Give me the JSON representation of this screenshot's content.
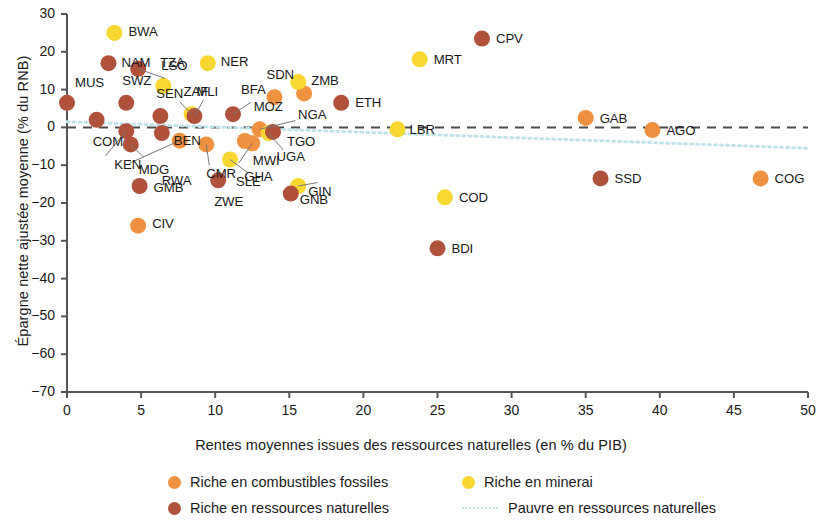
{
  "chart_data": {
    "type": "scatter",
    "title": "",
    "xlabel": "Rentes moyennes issues des ressources naturelles (en % du PIB)",
    "ylabel": "Épargne nette ajustée moyenne (% du RNB)",
    "xlim": [
      0,
      50
    ],
    "ylim": [
      -70,
      30
    ],
    "xticks": [
      0,
      5,
      10,
      15,
      20,
      25,
      30,
      35,
      40,
      45,
      50
    ],
    "yticks": [
      30,
      20,
      10,
      0,
      -10,
      -20,
      -30,
      -40,
      -50,
      -60,
      -70
    ],
    "grid": false,
    "legend_position": "bottom",
    "colors": {
      "fossil": "#f0913f",
      "mineral": "#f7d730",
      "natural": "#b0513c",
      "poor": "#bfe3e8",
      "zero_line": "#4a4a4a"
    },
    "reference_lines": [
      {
        "name": "zero-line",
        "kind": "dashed",
        "y": 0,
        "color": "#4a4a4a"
      },
      {
        "name": "poor-resources-trend",
        "kind": "dotted",
        "from": [
          0,
          1.5
        ],
        "to": [
          50,
          -5.5
        ],
        "color": "#bfe3e8"
      }
    ],
    "series": [
      {
        "name": "Riche en combustibles fossiles",
        "key": "fossil",
        "color": "#f0913f",
        "points": [
          {
            "code": "CIV",
            "x": 4.8,
            "y": -26.0,
            "lx": 14,
            "ly": -2
          },
          {
            "code": "RWA",
            "x": 7.6,
            "y": -3.5,
            "lx": -18,
            "ly": 40
          },
          {
            "code": "CMR",
            "x": 9.4,
            "y": -4.5,
            "lx": 0,
            "ly": 30
          },
          {
            "code": "MWI",
            "x": 12.0,
            "y": -3.6,
            "lx": 8,
            "ly": 20
          },
          {
            "code": "GHA",
            "x": 12.5,
            "y": -4.2,
            "lx": -8,
            "ly": 34
          },
          {
            "code": "MOZ",
            "x": 13.0,
            "y": -0.5,
            "lx": -6,
            "ly": -22
          },
          {
            "code": "SDN",
            "x": 14.0,
            "y": 8.0,
            "lx": -8,
            "ly": -22
          },
          {
            "code": "NGA",
            "x": 16.0,
            "y": 9.0,
            "lx": -6,
            "ly": 22
          },
          {
            "code": "GAB",
            "x": 35.0,
            "y": 2.5,
            "lx": 14,
            "ly": 1
          },
          {
            "code": "AGO",
            "x": 39.5,
            "y": -0.7,
            "lx": 14,
            "ly": 1
          },
          {
            "code": "COG",
            "x": 46.8,
            "y": -13.5,
            "lx": 14,
            "ly": 1
          }
        ]
      },
      {
        "name": "Riche en minerai",
        "key": "mineral",
        "color": "#f7d730",
        "points": [
          {
            "code": "BWA",
            "x": 3.2,
            "y": 25.0,
            "lx": 14,
            "ly": -1
          },
          {
            "code": "LSO",
            "x": 6.5,
            "y": 11.0,
            "lx": -2,
            "ly": -20
          },
          {
            "code": "ZAF",
            "x": 8.4,
            "y": 3.5,
            "lx": -8,
            "ly": -22
          },
          {
            "code": "NER",
            "x": 9.5,
            "y": 17.0,
            "lx": 13,
            "ly": -1
          },
          {
            "code": "SLE",
            "x": 11.0,
            "y": -8.5,
            "lx": 6,
            "ly": 22
          },
          {
            "code": "UGA",
            "x": 13.6,
            "y": -1.5,
            "lx": 8,
            "ly": 24
          },
          {
            "code": "ZMB",
            "x": 15.6,
            "y": 12.0,
            "lx": 13,
            "ly": -1
          },
          {
            "code": "GIN",
            "x": 15.6,
            "y": -15.5,
            "lx": 10,
            "ly": 6
          },
          {
            "code": "LBR",
            "x": 22.3,
            "y": -0.5,
            "lx": 12,
            "ly": 1
          },
          {
            "code": "MRT",
            "x": 23.8,
            "y": 18.0,
            "lx": 14,
            "ly": 1
          },
          {
            "code": "COD",
            "x": 25.5,
            "y": -18.5,
            "lx": 14,
            "ly": 1
          }
        ]
      },
      {
        "name": "Riche en ressources naturelles",
        "key": "natural",
        "color": "#b0513c",
        "points": [
          {
            "code": "MUS",
            "x": 0.0,
            "y": 6.5,
            "lx": 8,
            "ly": -20
          },
          {
            "code": "COM",
            "x": 2.0,
            "y": 2.0,
            "lx": -4,
            "ly": 22
          },
          {
            "code": "NAM",
            "x": 2.8,
            "y": 17.0,
            "lx": 13,
            "ly": 0
          },
          {
            "code": "SWZ",
            "x": 4.0,
            "y": 6.5,
            "lx": -4,
            "ly": -22
          },
          {
            "code": "KEN",
            "x": 4.0,
            "y": -1.0,
            "lx": -12,
            "ly": 34
          },
          {
            "code": "MDG",
            "x": 4.3,
            "y": -4.5,
            "lx": 8,
            "ly": 26
          },
          {
            "code": "GMB",
            "x": 4.9,
            "y": -15.5,
            "lx": 14,
            "ly": 2
          },
          {
            "code": "TZA",
            "x": 4.8,
            "y": 15.5,
            "lx": 22,
            "ly": -6
          },
          {
            "code": "SEN",
            "x": 6.3,
            "y": 3.0,
            "lx": -4,
            "ly": -22
          },
          {
            "code": "BEN",
            "x": 6.4,
            "y": -1.5,
            "lx": 12,
            "ly": 8
          },
          {
            "code": "MLI",
            "x": 8.6,
            "y": 3.0,
            "lx": 2,
            "ly": -24
          },
          {
            "code": "ZWE",
            "x": 10.2,
            "y": -14.0,
            "lx": -4,
            "ly": 22
          },
          {
            "code": "BFA",
            "x": 11.2,
            "y": 3.5,
            "lx": 8,
            "ly": -24
          },
          {
            "code": "TGO",
            "x": 13.9,
            "y": -1.2,
            "lx": 14,
            "ly": 10
          },
          {
            "code": "GNB",
            "x": 15.1,
            "y": -17.5,
            "lx": 9,
            "ly": 6
          },
          {
            "code": "ETH",
            "x": 18.5,
            "y": 6.5,
            "lx": 14,
            "ly": 0
          },
          {
            "code": "BDI",
            "x": 25.0,
            "y": -32.0,
            "lx": 14,
            "ly": 1
          },
          {
            "code": "CPV",
            "x": 28.0,
            "y": 23.5,
            "lx": 14,
            "ly": 0
          },
          {
            "code": "SSD",
            "x": 36.0,
            "y": -13.5,
            "lx": 14,
            "ly": 1
          }
        ]
      }
    ]
  },
  "legend": {
    "items": [
      {
        "label": "Riche en combustibles fossiles",
        "swatch": "fossil"
      },
      {
        "label": "Riche en minerai",
        "swatch": "mineral"
      },
      {
        "label": "Riche en ressources naturelles",
        "swatch": "natural"
      },
      {
        "label": "Pauvre en ressources naturelles",
        "swatch": "dashline"
      }
    ]
  }
}
